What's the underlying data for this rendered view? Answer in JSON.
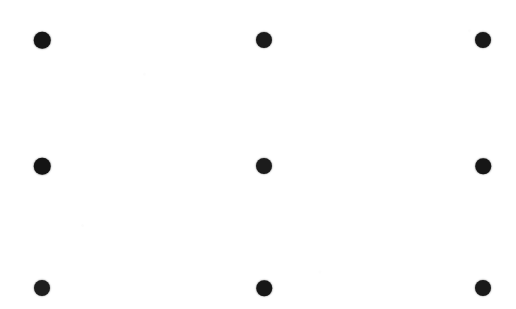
{
  "image": {
    "title": "Three by three dot grid",
    "width": 516,
    "height": 309,
    "background_color": "#ffffff",
    "dot_color": "#1a1a1a",
    "rows": 3,
    "columns": 3,
    "total_dots": 9,
    "column_centers_x": [
      42,
      264,
      483
    ],
    "row_centers_y": [
      40,
      166,
      288
    ],
    "nominal_dot_diameter": 16
  },
  "dots": [
    {
      "id": "dot-r1-c1",
      "row": 1,
      "column": 1,
      "cx": 42,
      "cy": 40,
      "d": 16.5,
      "color": "#151515"
    },
    {
      "id": "dot-r1-c2",
      "row": 1,
      "column": 2,
      "cx": 264,
      "cy": 40,
      "d": 16.0,
      "color": "#1a1a1a"
    },
    {
      "id": "dot-r1-c3",
      "row": 1,
      "column": 3,
      "cx": 483,
      "cy": 40,
      "d": 16.0,
      "color": "#191919"
    },
    {
      "id": "dot-r2-c1",
      "row": 2,
      "column": 1,
      "cx": 42,
      "cy": 166,
      "d": 16.5,
      "color": "#141414"
    },
    {
      "id": "dot-r2-c2",
      "row": 2,
      "column": 2,
      "cx": 264,
      "cy": 166,
      "d": 16.0,
      "color": "#1c1c1c"
    },
    {
      "id": "dot-r2-c3",
      "row": 2,
      "column": 3,
      "cx": 483,
      "cy": 166,
      "d": 15.5,
      "color": "#161616"
    },
    {
      "id": "dot-r3-c1",
      "row": 3,
      "column": 1,
      "cx": 42,
      "cy": 288,
      "d": 16.0,
      "color": "#1e1e1e"
    },
    {
      "id": "dot-r3-c2",
      "row": 3,
      "column": 2,
      "cx": 264,
      "cy": 288,
      "d": 15.5,
      "color": "#171717"
    },
    {
      "id": "dot-r3-c3",
      "row": 3,
      "column": 3,
      "cx": 483,
      "cy": 288,
      "d": 16.0,
      "color": "#1a1a1a"
    }
  ]
}
